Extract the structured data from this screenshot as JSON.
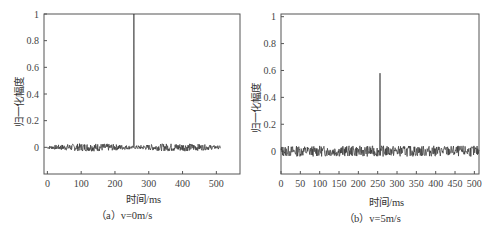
{
  "chart_data": [
    {
      "type": "line",
      "panel": "a",
      "caption": "（a）v=0m/s",
      "xlabel": "时间/ms",
      "ylabel": "归一化幅度",
      "xlim": [
        -10,
        570
      ],
      "ylim": [
        -0.2,
        1.0
      ],
      "xticks": [
        0,
        100,
        200,
        300,
        400,
        500
      ],
      "yticks": [
        0,
        0.2,
        0.4,
        0.6,
        0.8,
        1
      ],
      "yticklabels": [
        "0",
        "0.2",
        "0.4",
        "0.6",
        "0.8",
        "1"
      ],
      "grid": false,
      "series": [
        {
          "name": "normalized amplitude",
          "description": "noise band around 0 (approx ±0.03) from 0 to ~512 ms, single sharp peak reaching 1.0 at 256 ms",
          "noise_amplitude": 0.03,
          "x_range": [
            0,
            512
          ],
          "peak": {
            "x": 256,
            "y": 1.0
          }
        }
      ]
    },
    {
      "type": "line",
      "panel": "b",
      "caption": "（b）v=5m/s",
      "xlabel": "时间/ms",
      "ylabel": "归一化幅度",
      "xlim": [
        0,
        512
      ],
      "ylim": [
        -0.17,
        1.02
      ],
      "xticks": [
        0,
        50,
        100,
        150,
        200,
        250,
        300,
        350,
        400,
        450,
        500
      ],
      "yticks": [
        0,
        0.2,
        0.4,
        0.6,
        0.8,
        1
      ],
      "yticklabels": [
        "0",
        "0.2",
        "0.4",
        "0.6",
        "0.8",
        "1"
      ],
      "grid": false,
      "series": [
        {
          "name": "normalized amplitude",
          "description": "noise band around 0 (approx ±0.04) across 0–512 ms, peak reaching ~0.58 at 256 ms",
          "noise_amplitude": 0.04,
          "x_range": [
            0,
            512
          ],
          "peak": {
            "x": 256,
            "y": 0.58
          }
        }
      ]
    }
  ],
  "colors": {
    "axis": "#555555",
    "line": "#333333",
    "text": "#333333"
  }
}
